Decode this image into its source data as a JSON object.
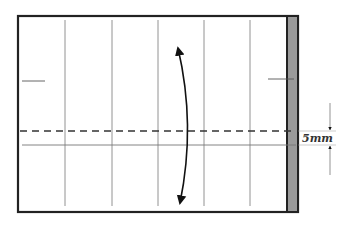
{
  "diagram": {
    "dimension_label": "5mm",
    "colors": {
      "outline": "#222222",
      "strip": "#9a9a9a",
      "guide": "#777777",
      "dashed": "#333333",
      "arrow": "#111111"
    },
    "elements": {
      "sheet": "paper-sheet",
      "strip": "gray-edge-strip",
      "fold_line": "valley-fold-dashed-line",
      "crease": "crease-line",
      "fold_arrow": "fold-and-unfold-arrow",
      "measure": "dimension-arrows"
    }
  }
}
